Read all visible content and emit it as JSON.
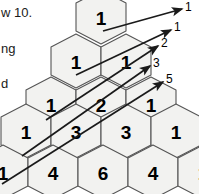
{
  "figure": {
    "colors": {
      "hex_fill": "#f2f2f0",
      "hex_stroke": "#555555",
      "number_color": "#000000",
      "arrow_color": "#1a1a1a",
      "background": "#ffffff"
    }
  },
  "chart_data": {
    "type": "table",
    "rows": [
      {
        "index": 0,
        "values": [
          "1"
        ]
      },
      {
        "index": 1,
        "values": [
          "1",
          "1"
        ]
      },
      {
        "index": 2,
        "values": [
          "1",
          "2",
          "1"
        ]
      },
      {
        "index": 3,
        "values": [
          "1",
          "3",
          "3",
          "1"
        ]
      },
      {
        "index": 4,
        "values": [
          "1",
          "4",
          "6",
          "4",
          "1"
        ]
      }
    ],
    "diagonal_sums": {
      "name": "Fibonacci numbers",
      "labels": [
        "1",
        "1",
        "2",
        "3",
        "5"
      ]
    }
  },
  "hexes": [
    {
      "id": "r0c0",
      "cx": 101,
      "cy": 17,
      "value": "1"
    },
    {
      "id": "r1c0",
      "cx": 76,
      "cy": 61,
      "value": "1"
    },
    {
      "id": "r1c1",
      "cx": 126,
      "cy": 61,
      "value": "1"
    },
    {
      "id": "r2c0",
      "cx": 51,
      "cy": 104,
      "value": "1"
    },
    {
      "id": "r2c1",
      "cx": 101,
      "cy": 104,
      "value": "2"
    },
    {
      "id": "r2c2",
      "cx": 151,
      "cy": 104,
      "value": "1"
    },
    {
      "id": "r3c0",
      "cx": 26,
      "cy": 131,
      "value": "1"
    },
    {
      "id": "r3c1",
      "cx": 76,
      "cy": 131,
      "value": "3"
    },
    {
      "id": "r3c2",
      "cx": 126,
      "cy": 131,
      "value": "3"
    },
    {
      "id": "r3c3",
      "cx": 176,
      "cy": 131,
      "value": "1"
    },
    {
      "id": "r4c0",
      "cx": 3,
      "cy": 172,
      "value": "1"
    },
    {
      "id": "r4c1",
      "cx": 53,
      "cy": 172,
      "value": "4"
    },
    {
      "id": "r4c2",
      "cx": 103,
      "cy": 172,
      "value": "6"
    },
    {
      "id": "r4c3",
      "cx": 153,
      "cy": 172,
      "value": "4"
    },
    {
      "id": "r4c4",
      "cx": 203,
      "cy": 172,
      "value": "1"
    }
  ],
  "arrows": [
    {
      "id": "a1",
      "x1": 103,
      "y1": 31,
      "x2": 182,
      "y2": 9,
      "label": "1",
      "lx": 185,
      "ly": 7
    },
    {
      "id": "a2",
      "x1": 76,
      "y1": 75,
      "x2": 171,
      "y2": 30,
      "label": "1",
      "lx": 174,
      "ly": 27
    },
    {
      "id": "a3",
      "x1": 46,
      "y1": 120,
      "x2": 158,
      "y2": 46,
      "label": "2",
      "lx": 161,
      "ly": 43
    },
    {
      "id": "a4",
      "x1": 22,
      "y1": 156,
      "x2": 150,
      "y2": 66,
      "label": "3",
      "lx": 153,
      "ly": 63
    },
    {
      "id": "a5",
      "x1": 2,
      "y1": 184,
      "x2": 163,
      "y2": 82,
      "label": "5",
      "lx": 166,
      "ly": 79
    }
  ],
  "side_notes": [
    {
      "id": "note-row10",
      "text": "w 10.",
      "x": 1,
      "y": 12
    },
    {
      "id": "note-ng",
      "text": "ng",
      "x": 1,
      "y": 48
    },
    {
      "id": "note-d",
      "text": "d",
      "x": 1,
      "y": 83
    }
  ]
}
